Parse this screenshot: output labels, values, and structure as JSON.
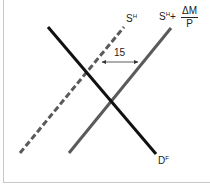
{
  "diagram": {
    "type": "supply-demand",
    "curves": [
      {
        "id": "supply_home",
        "label": "S",
        "superscript": "H",
        "style": "dashed",
        "color": "#5a5a5a"
      },
      {
        "id": "supply_shifted",
        "label": "S",
        "superscript": "H",
        "plus": "+",
        "fraction": {
          "numerator": "ΔM",
          "denominator": "P"
        },
        "style": "solid",
        "color": "#5a5a5a"
      },
      {
        "id": "demand_foreign",
        "label": "D",
        "superscript": "F",
        "style": "solid",
        "color": "#111111"
      }
    ],
    "shift_annotation": {
      "label": "15",
      "direction": "horizontal-double-arrow"
    }
  }
}
